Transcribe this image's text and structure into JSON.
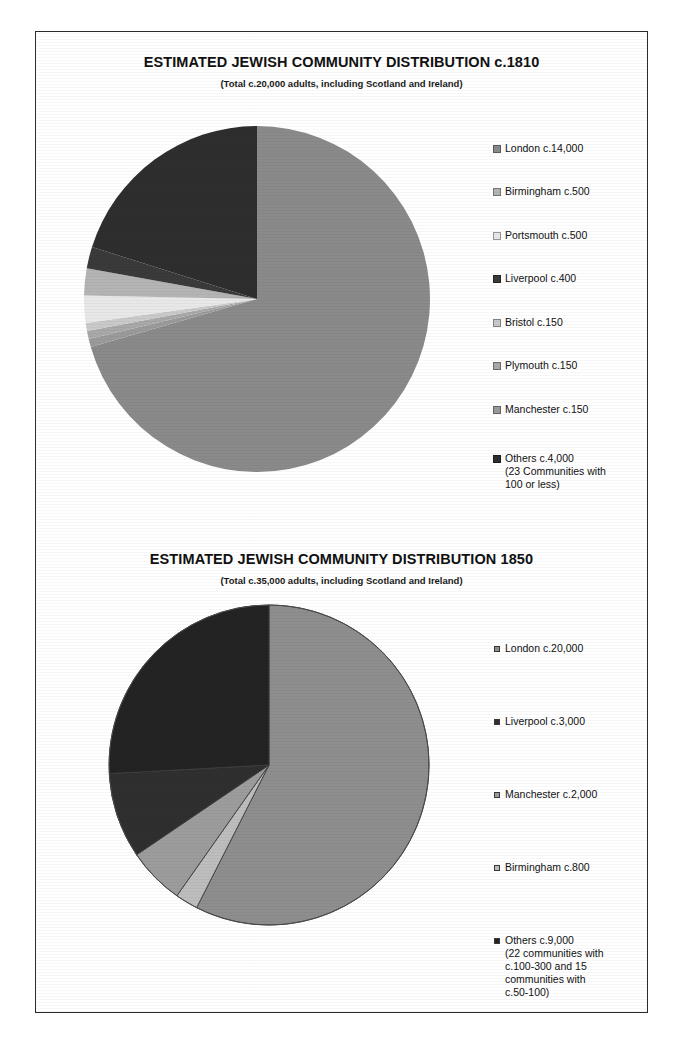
{
  "page": {
    "background_color": "#ffffff",
    "frame_border_color": "#2b2b2b"
  },
  "charts": [
    {
      "id": "chart-1810",
      "title": "ESTIMATED JEWISH COMMUNITY DISTRIBUTION c.1810",
      "subtitle": "(Total c.20,000 adults, including Scotland and Ireland)",
      "legend": [
        {
          "label": "London c.14,000",
          "sub": "",
          "color": "#8a8a8a"
        },
        {
          "label": "Birmingham c.500",
          "sub": "",
          "color": "#b4b4b4"
        },
        {
          "label": "Portsmouth c.500",
          "sub": "",
          "color": "#e8e8e8"
        },
        {
          "label": "Liverpool c.400",
          "sub": "",
          "color": "#3a3a3a"
        },
        {
          "label": "Bristol c.150",
          "sub": "",
          "color": "#c9c9c9"
        },
        {
          "label": "Plymouth c.150",
          "sub": "",
          "color": "#a8a8a8"
        },
        {
          "label": "Manchester c.150",
          "sub": "",
          "color": "#9a9a9a"
        },
        {
          "label": "Others c.4,000",
          "sub": "(23 Communities with\n100 or less)",
          "color": "#2e2e2e"
        }
      ]
    },
    {
      "id": "chart-1850",
      "title": "ESTIMATED JEWISH COMMUNITY DISTRIBUTION 1850",
      "subtitle": "(Total c.35,000 adults, including Scotland and Ireland)",
      "legend": [
        {
          "label": "London c.20,000",
          "sub": "",
          "color": "#8e8e8e"
        },
        {
          "label": "Liverpool c.3,000",
          "sub": "",
          "color": "#2f2f2f"
        },
        {
          "label": "Manchester c.2,000",
          "sub": "",
          "color": "#9c9c9c"
        },
        {
          "label": "Birmingham c.800",
          "sub": "",
          "color": "#bdbdbd"
        },
        {
          "label": "Others c.9,000",
          "sub": "(22 communities with\nc.100-300 and 15\ncommunities with\nc.50-100)",
          "color": "#232323"
        }
      ]
    }
  ],
  "chart_data": [
    {
      "type": "pie",
      "title": "ESTIMATED JEWISH COMMUNITY DISTRIBUTION c.1810",
      "subtitle": "(Total c.20,000 adults, including Scotland and Ireland)",
      "total": 20000,
      "units": "adults",
      "legend_position": "right",
      "start_angle_deg": 0,
      "direction": "clockwise",
      "categories": [
        "London",
        "Birmingham",
        "Portsmouth",
        "Liverpool",
        "Bristol",
        "Plymouth",
        "Manchester",
        "Others"
      ],
      "values": [
        14000,
        500,
        500,
        400,
        150,
        150,
        150,
        4000
      ],
      "labels": [
        "London c.14,000",
        "Birmingham c.500",
        "Portsmouth c.500",
        "Liverpool c.400",
        "Bristol c.150",
        "Plymouth c.150",
        "Manchester c.150",
        "Others c.4,000"
      ],
      "colors": [
        "#8a8a8a",
        "#b4b4b4",
        "#e8e8e8",
        "#3a3a3a",
        "#c9c9c9",
        "#a8a8a8",
        "#9a9a9a",
        "#2e2e2e"
      ],
      "annotations": [
        "Others c.4,000 (23 Communities with 100 or less)"
      ]
    },
    {
      "type": "pie",
      "title": "ESTIMATED JEWISH COMMUNITY DISTRIBUTION 1850",
      "subtitle": "(Total c.35,000 adults, including Scotland and Ireland)",
      "total": 35000,
      "units": "adults",
      "legend_position": "right",
      "start_angle_deg": 0,
      "direction": "clockwise",
      "categories": [
        "London",
        "Liverpool",
        "Manchester",
        "Birmingham",
        "Others"
      ],
      "values": [
        20000,
        3000,
        2000,
        800,
        9000
      ],
      "labels": [
        "London c.20,000",
        "Liverpool c.3,000",
        "Manchester c.2,000",
        "Birmingham c.800",
        "Others c.9,000"
      ],
      "colors": [
        "#8e8e8e",
        "#2f2f2f",
        "#9c9c9c",
        "#bdbdbd",
        "#232323"
      ],
      "annotations": [
        "Others c.9,000 (22 communities with c.100-300 and 15 communities with c.50-100)"
      ]
    }
  ]
}
